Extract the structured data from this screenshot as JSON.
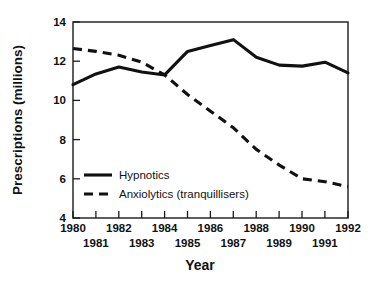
{
  "chart_data": {
    "type": "line",
    "title": "",
    "xlabel": "Year",
    "ylabel": "Prescriptions (millions)",
    "x": [
      1980,
      1981,
      1982,
      1983,
      1984,
      1985,
      1986,
      1987,
      1988,
      1989,
      1990,
      1991,
      1992
    ],
    "xlim": [
      1980,
      1992
    ],
    "ylim": [
      4,
      14
    ],
    "yticks": [
      4,
      6,
      8,
      10,
      12,
      14
    ],
    "ytick_labels": [
      "4",
      "6",
      "8",
      "10",
      "12",
      "14"
    ],
    "xticks": [
      1980,
      1981,
      1982,
      1983,
      1984,
      1985,
      1986,
      1987,
      1988,
      1989,
      1990,
      1991,
      1992
    ],
    "xtick_labels_top_row": [
      "1980",
      "1982",
      "1984",
      "1986",
      "1988",
      "1990",
      "1992"
    ],
    "xtick_labels_bottom_row": [
      "1981",
      "1983",
      "1985",
      "1987",
      "1989",
      "1991"
    ],
    "grid": false,
    "legend_position": "lower-left-inside",
    "series": [
      {
        "name": "Hypnotics",
        "style": "solid",
        "color": "#111111",
        "values": [
          10.8,
          11.35,
          11.7,
          11.45,
          11.3,
          12.5,
          12.8,
          13.1,
          12.2,
          11.8,
          11.75,
          11.95,
          11.4
        ]
      },
      {
        "name": "Anxiolytics (tranquillisers)",
        "style": "dashed",
        "color": "#111111",
        "values": [
          12.65,
          12.5,
          12.3,
          11.95,
          11.3,
          10.3,
          9.45,
          8.6,
          7.5,
          6.7,
          6.0,
          5.85,
          5.6
        ]
      }
    ]
  },
  "axis": {
    "y_title": "Prescriptions (millions)",
    "x_title": "Year"
  },
  "legend": {
    "items": [
      {
        "label": "Hypnotics"
      },
      {
        "label": "Anxiolytics (tranquillisers)"
      }
    ]
  }
}
